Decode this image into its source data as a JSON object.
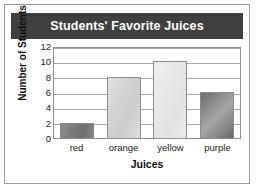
{
  "figure": {
    "border_color": "#9a9a9a",
    "background": "#ffffff"
  },
  "title_bar": {
    "background": "#3f3f3f",
    "text_color": "#ffffff"
  },
  "chart_data": {
    "type": "bar",
    "title": "Students' Favorite Juices",
    "xlabel": "Juices",
    "ylabel": "Number of Students",
    "categories": [
      "red",
      "orange",
      "yellow",
      "purple"
    ],
    "values": [
      2,
      8,
      10,
      6
    ],
    "ylim": [
      0,
      12
    ],
    "yticks": [
      12,
      10,
      8,
      6,
      4,
      2,
      0
    ],
    "grid": true,
    "grid_axis": "y",
    "legend": false,
    "bar_colors": [
      "#7b7b7b",
      "#d6d6d6",
      "#e9e9e9",
      "#8e8e8e"
    ],
    "series": [
      {
        "name": "Number of Students",
        "values": [
          2,
          8,
          10,
          6
        ]
      }
    ]
  }
}
